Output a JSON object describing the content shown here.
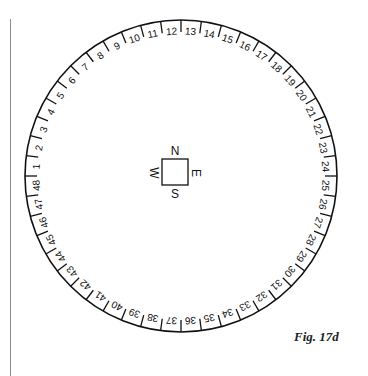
{
  "figure": {
    "caption": "Fig. 17d"
  },
  "dial": {
    "center": [
      181,
      176
    ],
    "radius": 156,
    "tick_length": 12,
    "divisions": 48,
    "label_top_number": 13,
    "labels": [
      "1",
      "2",
      "3",
      "4",
      "5",
      "6",
      "7",
      "8",
      "9",
      "10",
      "11",
      "12",
      "13",
      "14",
      "15",
      "16",
      "17",
      "18",
      "19",
      "20",
      "21",
      "22",
      "23",
      "24",
      "25",
      "26",
      "27",
      "28",
      "29",
      "30",
      "31",
      "32",
      "33",
      "34",
      "35",
      "36",
      "37",
      "38",
      "39",
      "40",
      "41",
      "42",
      "43",
      "44",
      "45",
      "46",
      "47",
      "48"
    ],
    "stroke_color": "#111111"
  },
  "compass_square": {
    "north": "N",
    "east": "E",
    "south": "S",
    "west": "W",
    "size": 26
  }
}
